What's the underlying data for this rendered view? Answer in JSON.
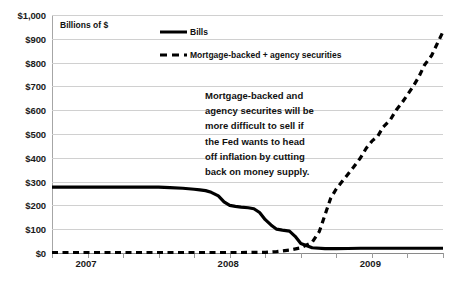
{
  "chart_data": {
    "type": "line",
    "title": "",
    "subtitle": "",
    "xlabel": "",
    "ylabel": "Billions of $",
    "ylim": [
      0,
      1000
    ],
    "yticks": [
      0,
      100,
      200,
      300,
      400,
      500,
      600,
      700,
      800,
      900,
      1000
    ],
    "ytick_labels": [
      "$0",
      "$100",
      "$200",
      "$300",
      "$400",
      "$500",
      "$600",
      "$700",
      "$800",
      "$900",
      "$1,000"
    ],
    "xlim": [
      2007.0,
      2009.75
    ],
    "xtick_labels": [
      "2007",
      "2008",
      "2009"
    ],
    "xtick_values": [
      2007,
      2008,
      2009
    ],
    "grid": true,
    "legend_position": "top-center",
    "colors": {
      "series": "#000000",
      "gridline": "#d0d0d0",
      "axis": "#8a8a8a",
      "text": "#111111"
    },
    "series": [
      {
        "name": "Bills",
        "style": "solid",
        "x": [
          2007.0,
          2007.08,
          2007.17,
          2007.25,
          2007.33,
          2007.42,
          2007.5,
          2007.58,
          2007.67,
          2007.75,
          2007.83,
          2007.92,
          2008.0,
          2008.04,
          2008.08,
          2008.12,
          2008.17,
          2008.21,
          2008.25,
          2008.29,
          2008.33,
          2008.38,
          2008.42,
          2008.46,
          2008.5,
          2008.54,
          2008.58,
          2008.62,
          2008.67,
          2008.71,
          2008.75,
          2008.83,
          2008.92,
          2009.0,
          2009.08,
          2009.17,
          2009.25,
          2009.33,
          2009.42,
          2009.5,
          2009.58,
          2009.67,
          2009.75
        ],
        "y": [
          277,
          277,
          277,
          277,
          277,
          277,
          277,
          277,
          277,
          277,
          275,
          272,
          268,
          265,
          262,
          255,
          240,
          215,
          200,
          196,
          193,
          190,
          186,
          170,
          140,
          118,
          100,
          96,
          92,
          70,
          40,
          22,
          18,
          18,
          19,
          20,
          20,
          20,
          20,
          20,
          20,
          20,
          20
        ]
      },
      {
        "name": "Mortgage-backed + agency securities",
        "style": "dashed",
        "x": [
          2007.0,
          2007.17,
          2007.33,
          2007.5,
          2007.67,
          2007.83,
          2008.0,
          2008.17,
          2008.33,
          2008.5,
          2008.58,
          2008.67,
          2008.75,
          2008.83,
          2008.88,
          2008.92,
          2008.96,
          2009.0,
          2009.04,
          2009.08,
          2009.12,
          2009.17,
          2009.21,
          2009.25,
          2009.29,
          2009.33,
          2009.38,
          2009.42,
          2009.46,
          2009.5,
          2009.54,
          2009.58,
          2009.62,
          2009.67,
          2009.71,
          2009.75
        ],
        "y": [
          2,
          2,
          2,
          2,
          2,
          2,
          2,
          2,
          2,
          3,
          6,
          12,
          22,
          45,
          90,
          160,
          230,
          270,
          300,
          330,
          360,
          400,
          440,
          470,
          490,
          530,
          560,
          600,
          630,
          665,
          700,
          740,
          790,
          830,
          880,
          930
        ]
      }
    ],
    "annotations": [
      {
        "name": "mbs-commentary",
        "lines": [
          "Mortgage-backed and",
          "agency securites will be",
          "more difficult to sell if",
          "the Fed wants to head",
          "off inflation by cutting",
          "back on money supply."
        ]
      }
    ]
  }
}
